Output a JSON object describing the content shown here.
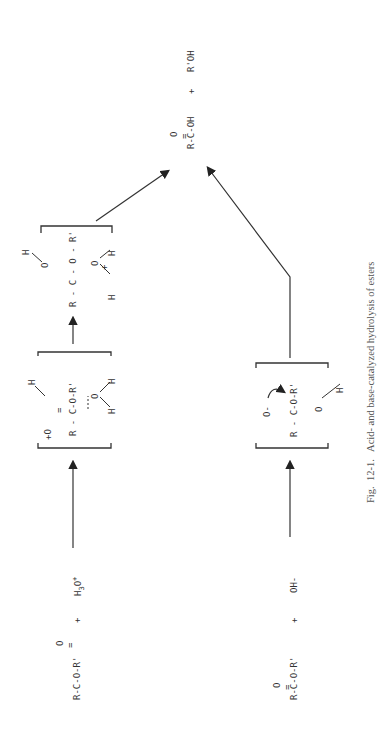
{
  "figure": {
    "caption": "Fig.  12-1.   Acid- and base-catalyzed hydrolysis of esters"
  },
  "acid_pathway": {
    "reactant_ester": {
      "carbonyl_o": "O",
      "double_bond": "=",
      "chain": "R-C-O-R'"
    },
    "plus": "+",
    "catalyst": "H3O+",
    "intermediate_1": {
      "label": "protonated ester + water",
      "o_plus": "+O",
      "double_bond": "=",
      "chain": "R - C-O-R'",
      "water_o": "O",
      "h_top": "H",
      "h1": "H",
      "h2": "H"
    },
    "intermediate_2": {
      "label": "tetrahedral intermediate",
      "chain": "R - C - O - R'",
      "oh_left": "O",
      "h_left": "H",
      "oh2_right": "O",
      "plus": "+",
      "h_right_1": "H",
      "h_right_2": "H"
    }
  },
  "base_pathway": {
    "reactant_ester": {
      "carbonyl_o": "O",
      "double_bond": "=",
      "chain": "R-C-O-R'"
    },
    "plus": "+",
    "catalyst": "OH-",
    "intermediate": {
      "label": "tetrahedral alkoxide intermediate",
      "o_minus": "O-",
      "chain": "R - C-O-R'",
      "oh_o": "O",
      "oh_h": "H"
    }
  },
  "products": {
    "acid": {
      "carbonyl_o": "O",
      "double_bond": "=",
      "chain": "R-C-OH"
    },
    "plus": "+",
    "alcohol": "R'OH"
  },
  "colors": {
    "ink": "#333333",
    "caption": "#555555",
    "background": "#ffffff"
  }
}
